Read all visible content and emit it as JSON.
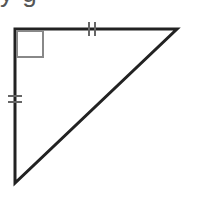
{
  "heading": {
    "cropped_text": "y         g"
  },
  "figure": {
    "type": "right isosceles triangle",
    "vertices": {
      "right_angle": [
        15,
        29
      ],
      "top_right": [
        177,
        29
      ],
      "bottom": [
        15,
        183
      ]
    },
    "right_angle_marker": {
      "x": 17,
      "y": 31,
      "size": 26,
      "color": "#888888"
    },
    "congruence_marks": [
      {
        "side": "top",
        "ticks": 2,
        "at": [
          92,
          29
        ]
      },
      {
        "side": "left",
        "ticks": 2,
        "at": [
          15,
          99
        ]
      }
    ],
    "stroke_color": "#222222"
  }
}
